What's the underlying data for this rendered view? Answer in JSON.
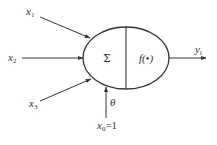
{
  "diagram": {
    "type": "artificial-neuron",
    "colors": {
      "stroke": "#333333",
      "background": "#ffffff"
    },
    "node": {
      "sum_symbol": "Σ",
      "activation_label": "f(•)"
    },
    "inputs": [
      {
        "var": "x",
        "sub": "1"
      },
      {
        "var": "x",
        "sub": "2"
      },
      {
        "var": "x",
        "sub": "3"
      }
    ],
    "bias": {
      "weight_label": "θ",
      "var": "x",
      "sub": "0",
      "value": "=1"
    },
    "output": {
      "var": "y",
      "sub": "i"
    }
  }
}
